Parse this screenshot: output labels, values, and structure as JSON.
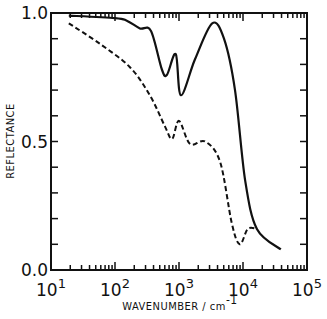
{
  "chart_data": {
    "type": "line",
    "title": "",
    "xlabel": "WAVENUMBER / cm",
    "xlabel_superscript": "-1",
    "ylabel": "REFLECTANCE",
    "xscale": "log",
    "xlim": [
      10,
      100000
    ],
    "ylim": [
      0.0,
      1.0
    ],
    "x_ticks": [
      {
        "base": "10",
        "exp": "1",
        "value": 10
      },
      {
        "base": "10",
        "exp": "2",
        "value": 100
      },
      {
        "base": "10",
        "exp": "3",
        "value": 1000
      },
      {
        "base": "10",
        "exp": "4",
        "value": 10000
      },
      {
        "base": "10",
        "exp": "5",
        "value": 100000
      }
    ],
    "y_ticks": [
      {
        "label": "0.0",
        "value": 0.0
      },
      {
        "label": "0.5",
        "value": 0.5
      },
      {
        "label": "1.0",
        "value": 1.0
      }
    ],
    "y_minor_step": 0.1,
    "grid": false,
    "legend": null,
    "series": [
      {
        "name": "solid",
        "style": "solid",
        "color": "#111111",
        "x": [
          19,
          100,
          153,
          245,
          365,
          540,
          650,
          890,
          1070,
          1780,
          3300,
          5050,
          7500,
          10800,
          16500,
          39000
        ],
        "y": [
          0.99,
          0.98,
          0.97,
          0.94,
          0.93,
          0.78,
          0.76,
          0.84,
          0.68,
          0.82,
          0.96,
          0.9,
          0.7,
          0.35,
          0.16,
          0.08
        ]
      },
      {
        "name": "dashed",
        "style": "dashed",
        "color": "#111111",
        "x": [
          19,
          58,
          170,
          350,
          600,
          780,
          1000,
          1490,
          2560,
          4400,
          6700,
          8900,
          11900,
          16500
        ],
        "y": [
          0.96,
          0.88,
          0.79,
          0.68,
          0.56,
          0.51,
          0.58,
          0.49,
          0.5,
          0.42,
          0.18,
          0.1,
          0.16,
          0.16
        ]
      }
    ]
  }
}
